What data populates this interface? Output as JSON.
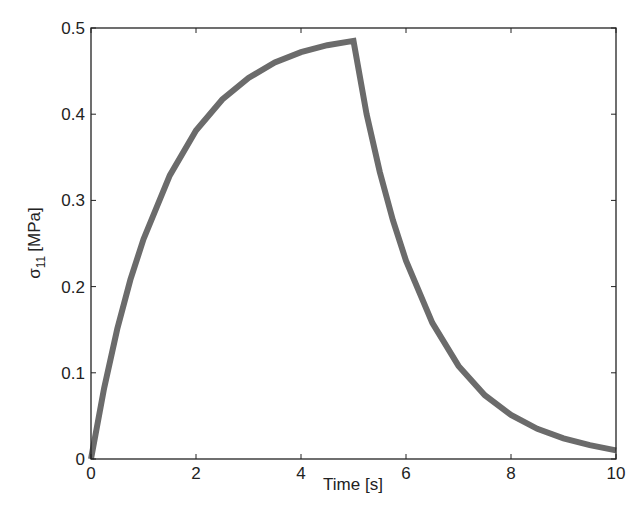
{
  "chart_data": {
    "type": "line",
    "title": "",
    "xlabel": "Time [s]",
    "ylabel": "σ11 [MPa]",
    "ylabel_parts": {
      "symbol": "σ",
      "subscript": "11",
      "unit": "[MPa]"
    },
    "xlim": [
      0,
      10
    ],
    "ylim": [
      0,
      0.5
    ],
    "xticks": [
      0,
      2,
      4,
      6,
      8,
      10
    ],
    "xtick_labels": [
      "0",
      "2",
      "4",
      "6",
      "8",
      "10"
    ],
    "yticks": [
      0,
      0.1,
      0.2,
      0.3,
      0.4,
      0.5
    ],
    "ytick_labels": [
      "0",
      "0.1",
      "0.2",
      "0.3",
      "0.4",
      "0.5"
    ],
    "grid": false,
    "legend": null,
    "series": [
      {
        "name": "sigma_11",
        "color": "#6b6b6b",
        "x": [
          0,
          0.25,
          0.5,
          0.75,
          1,
          1.5,
          2,
          2.5,
          3,
          3.5,
          4,
          4.5,
          5,
          5.25,
          5.5,
          5.75,
          6,
          6.5,
          7,
          7.5,
          8,
          8.5,
          9,
          9.5,
          10
        ],
        "values": [
          0,
          0.082,
          0.151,
          0.208,
          0.255,
          0.329,
          0.381,
          0.417,
          0.442,
          0.46,
          0.472,
          0.48,
          0.485,
          0.4,
          0.333,
          0.277,
          0.23,
          0.158,
          0.108,
          0.074,
          0.051,
          0.035,
          0.024,
          0.016,
          0.01
        ]
      }
    ]
  }
}
